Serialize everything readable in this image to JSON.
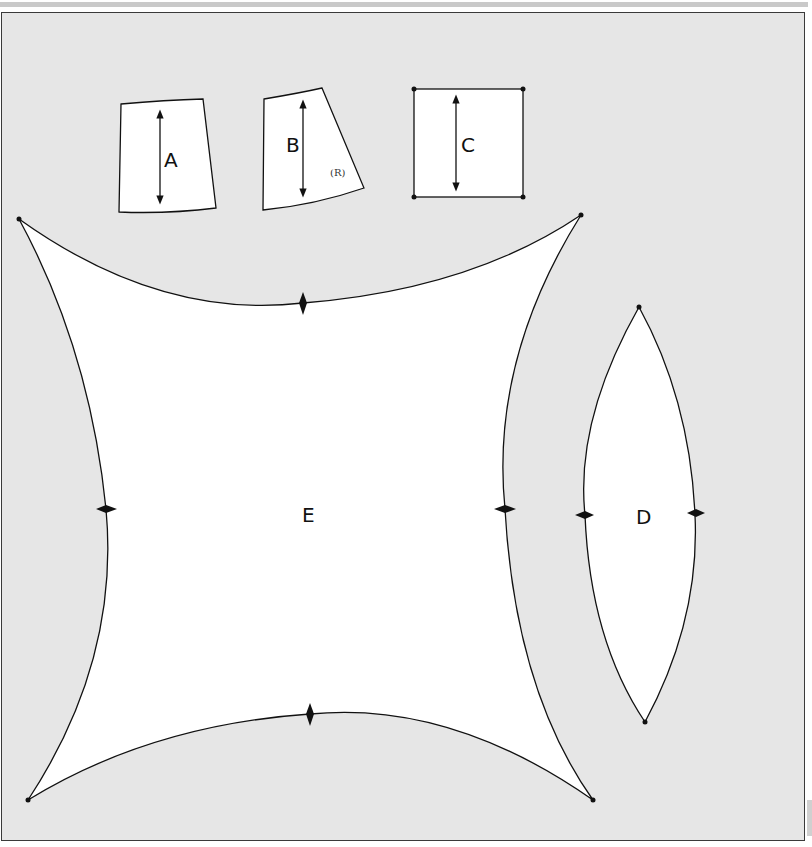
{
  "diagram": {
    "type": "sewing-pattern-pieces",
    "background_color": "#e6e6e6",
    "piece_fill": "#ffffff",
    "stroke_color": "#111111",
    "pieces": [
      {
        "id": "A",
        "label": "A",
        "shape": "trapezoid",
        "grainline": true
      },
      {
        "id": "B",
        "label": "B",
        "note": "(R)",
        "shape": "slanted trapezoid",
        "grainline": true
      },
      {
        "id": "C",
        "label": "C",
        "shape": "square",
        "grainline": true,
        "corner_dots": 4
      },
      {
        "id": "D",
        "label": "D",
        "shape": "lens / vesica",
        "notches": 2,
        "end_dots": 2
      },
      {
        "id": "E",
        "label": "E",
        "shape": "concave-sided square",
        "notches": 4,
        "corner_dots": 4
      }
    ]
  }
}
